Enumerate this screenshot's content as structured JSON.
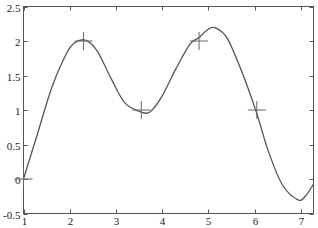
{
  "chart_data": {
    "type": "line",
    "title": "",
    "xlabel": "",
    "ylabel": "",
    "xlim": [
      1,
      7.28
    ],
    "ylim": [
      -0.5,
      2.5
    ],
    "grid": false,
    "legend": null,
    "x_ticks": [
      1,
      2,
      3,
      4,
      5,
      6,
      7
    ],
    "x_tick_labels": [
      "1",
      "2",
      "3",
      "4",
      "5",
      "6",
      "7"
    ],
    "y_ticks": [
      -0.5,
      0,
      0.5,
      1,
      1.5,
      2,
      2.5
    ],
    "y_tick_labels": [
      "-0.5",
      "0",
      "0.5",
      "1",
      "1.5",
      "2",
      "2.5"
    ],
    "series": [
      {
        "name": "spline",
        "style": "line",
        "x": [
          1.0,
          1.3,
          1.6,
          1.9,
          2.1,
          2.35,
          2.6,
          2.9,
          3.2,
          3.55,
          3.75,
          4.0,
          4.3,
          4.6,
          4.8,
          5.0,
          5.15,
          5.4,
          5.7,
          6.05,
          6.3,
          6.6,
          6.93,
          7.1,
          7.28
        ],
        "y": [
          0.0,
          0.65,
          1.3,
          1.78,
          1.97,
          2.01,
          1.85,
          1.45,
          1.1,
          0.97,
          0.98,
          1.2,
          1.6,
          1.95,
          2.05,
          2.17,
          2.19,
          2.05,
          1.6,
          0.95,
          0.4,
          -0.08,
          -0.3,
          -0.25,
          -0.07
        ]
      },
      {
        "name": "data points",
        "style": "marker-plus",
        "x": [
          1.0,
          2.3,
          3.55,
          4.8,
          6.05
        ],
        "y": [
          0,
          2,
          1,
          2,
          1
        ]
      }
    ]
  },
  "axis_labels": {
    "x": [
      "1",
      "2",
      "3",
      "4",
      "5",
      "6",
      "7"
    ],
    "y": [
      "-0.5",
      "0",
      "0.5",
      "1",
      "1.5",
      "2",
      "2.5"
    ]
  }
}
